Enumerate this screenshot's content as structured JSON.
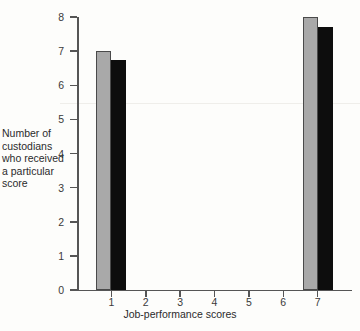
{
  "chart_data": {
    "type": "bar",
    "title": "",
    "xlabel": "Job-performance scores",
    "ylabel": "Number of custodians who received a particular score",
    "categories": [
      "1",
      "2",
      "3",
      "4",
      "5",
      "6",
      "7"
    ],
    "xlim": [
      0.5,
      7.5
    ],
    "ylim": [
      0,
      8
    ],
    "ytick_labels": [
      "0",
      "1",
      "2",
      "3",
      "4",
      "5",
      "6",
      "7",
      "8"
    ],
    "ytick_values": [
      0,
      1,
      2,
      3,
      4,
      5,
      6,
      7,
      8
    ],
    "xtick_labels": [
      "1",
      "2",
      "3",
      "4",
      "5",
      "6",
      "7"
    ],
    "grid": false,
    "legend": "none",
    "series": [
      {
        "name": "gray",
        "color": "#a9a9a9",
        "values": [
          7,
          0,
          0,
          0,
          0,
          0,
          8
        ]
      },
      {
        "name": "black",
        "color": "#0d0d0d",
        "values": [
          6.75,
          0,
          0,
          0,
          0,
          0,
          7.7
        ]
      }
    ]
  },
  "axis": {
    "y_title_lines": [
      "Number of",
      "custodians",
      "who received",
      "a particular",
      "score"
    ],
    "x_title": "Job-performance scores"
  },
  "colors": {
    "background": "#fdfdfb",
    "axis": "#555555",
    "series_gray": "#a9a9a9",
    "series_gray_outline": "#4a4a4a",
    "series_black": "#0d0d0d",
    "text": "#2b2b2b"
  }
}
